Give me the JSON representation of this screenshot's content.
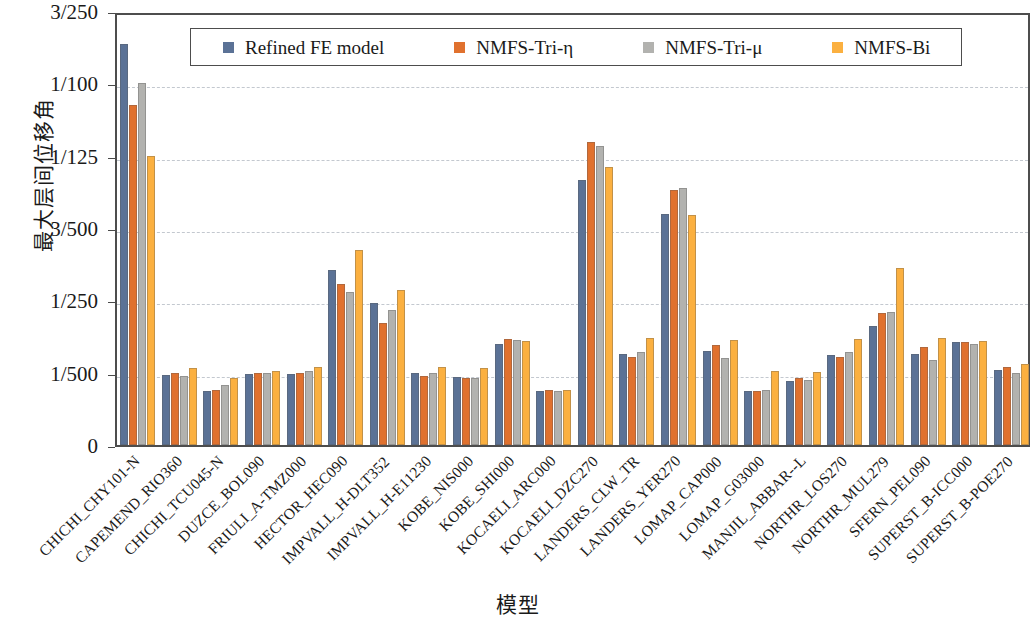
{
  "chart_data": {
    "type": "bar",
    "title": "",
    "xlabel": "模型",
    "ylabel": "最大层间位移角",
    "grid": true,
    "legend_position": "top-center",
    "ylim": [
      0,
      0.012
    ],
    "ytick_values": [
      0,
      0.002,
      0.004,
      0.006,
      0.008,
      0.01,
      0.012
    ],
    "ytick_labels": [
      "0",
      "1/500",
      "1/250",
      "3/500",
      "1/125",
      "1/100",
      "3/250"
    ],
    "categories": [
      "CHICHI_CHY101-N",
      "CAPEMEND_RIO360",
      "CHICHI_TCU045-N",
      "DUZCE_BOL090",
      "FRIULI_A-TMZ000",
      "HECTOR_HEC090",
      "IMPVALL_H-DLT352",
      "IMPVALL_H-E11230",
      "KOBE_NIS000",
      "KOBE_SHI000",
      "KOCAELI_ARC000",
      "KOCAELI_DZC270",
      "LANDERS_CLW_TR",
      "LANDERS_YER270",
      "LOMAP_CAP000",
      "LOMAP_G03000",
      "MANJIL_ABBAR--L",
      "NORTHR_LOS270",
      "NORTHR_MUL279",
      "SFERN_PEL090",
      "SUPERST_B-ICC000",
      "SUPERST_B-POE270"
    ],
    "series": [
      {
        "name": "Refined FE model",
        "color": "#5b7296",
        "values": [
          0.01108,
          0.00194,
          0.00148,
          0.00196,
          0.00196,
          0.00484,
          0.00392,
          0.00198,
          0.00188,
          0.0028,
          0.00148,
          0.00732,
          0.00252,
          0.0064,
          0.0026,
          0.00148,
          0.00178,
          0.0025,
          0.0033,
          0.00252,
          0.00286,
          0.00208
        ]
      },
      {
        "name": "NMFS-Tri-η",
        "color": "#e0712e",
        "values": [
          0.0094,
          0.00198,
          0.00152,
          0.00198,
          0.002,
          0.00446,
          0.00336,
          0.00192,
          0.00186,
          0.00292,
          0.00152,
          0.00838,
          0.00244,
          0.00704,
          0.00276,
          0.0015,
          0.00184,
          0.00244,
          0.00366,
          0.00272,
          0.00284,
          0.00216
        ]
      },
      {
        "name": "NMFS-Tri-μ",
        "color": "#b2b2af",
        "values": [
          0.01,
          0.00192,
          0.00166,
          0.00198,
          0.00206,
          0.00424,
          0.00372,
          0.00198,
          0.00186,
          0.0029,
          0.0015,
          0.00826,
          0.00256,
          0.0071,
          0.0024,
          0.00152,
          0.0018,
          0.00258,
          0.00368,
          0.00234,
          0.0028,
          0.002
        ]
      },
      {
        "name": "NMFS-Bi",
        "color": "#fbb040",
        "values": [
          0.008,
          0.00212,
          0.00186,
          0.00204,
          0.00216,
          0.0054,
          0.00428,
          0.00216,
          0.00212,
          0.00288,
          0.00152,
          0.00768,
          0.00296,
          0.00636,
          0.0029,
          0.00206,
          0.00202,
          0.00294,
          0.0049,
          0.00296,
          0.00288,
          0.00224
        ]
      }
    ]
  },
  "legend": {
    "items": [
      {
        "label": "Refined FE model"
      },
      {
        "label": "NMFS-Tri-η"
      },
      {
        "label": "NMFS-Tri-μ"
      },
      {
        "label": "NMFS-Bi"
      }
    ]
  },
  "axes": {
    "y_title": "最大层间位移角",
    "x_title": "模型"
  }
}
